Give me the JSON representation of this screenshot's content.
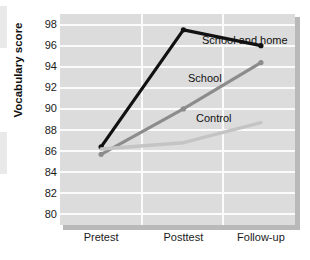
{
  "chart_data": {
    "type": "line",
    "title": "",
    "xlabel": "",
    "ylabel": "Vocabulary score",
    "categories": [
      "Pretest",
      "Posttest",
      "Follow-up"
    ],
    "ylim": [
      79,
      99
    ],
    "yticks": [
      80,
      82,
      84,
      86,
      88,
      90,
      92,
      94,
      96,
      98
    ],
    "grid": "horizontal and vertical white gridlines on gray panel",
    "legend_position": "inline labels beside each line",
    "series": [
      {
        "name": "School and home",
        "values": [
          86.4,
          97.5,
          96.0
        ],
        "color": "#111111",
        "markers": true
      },
      {
        "name": "School",
        "values": [
          85.7,
          90.0,
          94.4
        ],
        "color": "#8c8c8c",
        "markers": true
      },
      {
        "name": "Control",
        "values": [
          86.2,
          86.8,
          88.7
        ],
        "color": "#c4c4c4",
        "markers": false
      }
    ]
  },
  "axis": {
    "y_title": "Vocabulary score",
    "y_tick_labels": [
      "98",
      "96",
      "94",
      "92",
      "90",
      "88",
      "86",
      "84",
      "82",
      "80"
    ],
    "x_tick_labels": [
      "Pretest",
      "Posttest",
      "Follow-up"
    ]
  },
  "labels": {
    "school_and_home": "School and home",
    "school": "School",
    "control": "Control"
  }
}
